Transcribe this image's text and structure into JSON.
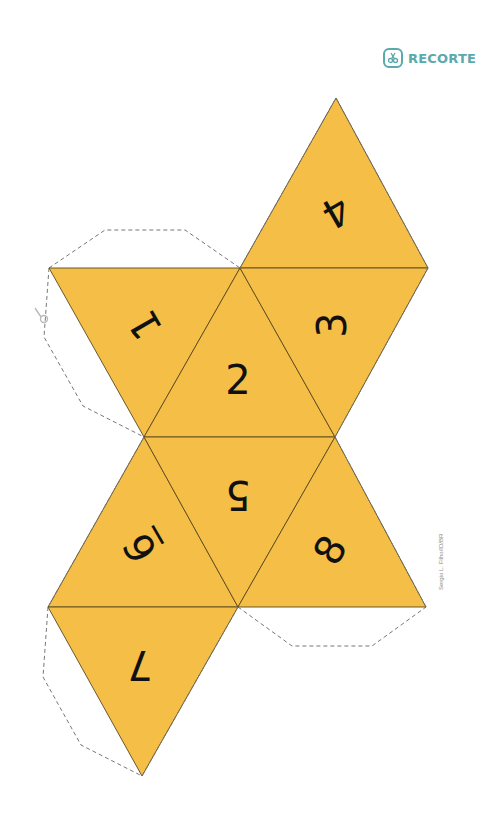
{
  "badge": {
    "icon": "scissors-icon",
    "label": "RECORTE",
    "color": "#5aa9ac"
  },
  "credit": "Sergio L. Filho/ID/BR",
  "colors": {
    "face_fill": "#F5BE47",
    "edge": "#5a4a20",
    "cut_line": "#777777",
    "digit": "#111111"
  },
  "faces": [
    {
      "number": "4",
      "points": "336,98 240,268 428,268",
      "label_x": 336,
      "label_y": 212,
      "rotate": 150
    },
    {
      "number": "1",
      "points": "49,268 240,268 144,437",
      "label_x": 145,
      "label_y": 325,
      "rotate": -120
    },
    {
      "number": "2",
      "points": "240,268 144,437 335,437",
      "label_x": 238,
      "label_y": 380,
      "rotate": 0
    },
    {
      "number": "3",
      "points": "240,268 428,268 335,437",
      "label_x": 332,
      "label_y": 325,
      "rotate": -90
    },
    {
      "number": "6̲",
      "points": "144,437 48,607 238,607",
      "label_x": 140,
      "label_y": 548,
      "rotate": -120
    },
    {
      "number": "5",
      "points": "144,437 335,437 238,607",
      "label_x": 238,
      "label_y": 495,
      "rotate": 180
    },
    {
      "number": "8",
      "points": "335,437 238,607 426,607",
      "label_x": 330,
      "label_y": 550,
      "rotate": -60
    },
    {
      "number": "7",
      "points": "48,607 238,607 142,776",
      "label_x": 140,
      "label_y": 665,
      "rotate": 180
    }
  ],
  "flaps": [
    "49,268 105,230 185,230 240,268",
    "49,268 44,337 83,406 144,437",
    "48,607 43,677 81,745 142,776",
    "238,607 292,646 372,646 426,607"
  ]
}
